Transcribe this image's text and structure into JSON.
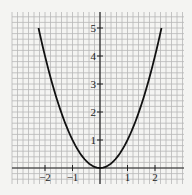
{
  "chart_data": {
    "type": "line",
    "title": "",
    "xlabel": "",
    "ylabel": "",
    "function": "y = x^2",
    "xlim": [
      -3.2,
      3.0
    ],
    "ylim": [
      -0.55,
      5.6
    ],
    "grid": true,
    "grid_minor_step": 0.2,
    "x_ticks": [
      -2,
      -1,
      1,
      2
    ],
    "x_tick_labels": [
      "−2",
      "−1",
      "1",
      "2"
    ],
    "y_ticks": [
      1,
      2,
      3,
      4,
      5
    ],
    "y_tick_labels": [
      "1",
      "2",
      "3",
      "4",
      "5"
    ],
    "series": [
      {
        "name": "y = x^2",
        "x": [
          -2.236,
          -2,
          -1.5,
          -1,
          -0.5,
          0,
          0.5,
          1,
          1.5,
          2,
          2.236
        ],
        "y": [
          5,
          4,
          2.25,
          1,
          0.25,
          0,
          0.25,
          1,
          2.25,
          4,
          5
        ]
      }
    ],
    "colors": {
      "curve": "#111111",
      "axis": "#222222",
      "grid": "#b8b8b8",
      "background": "#f4f4f2"
    }
  }
}
